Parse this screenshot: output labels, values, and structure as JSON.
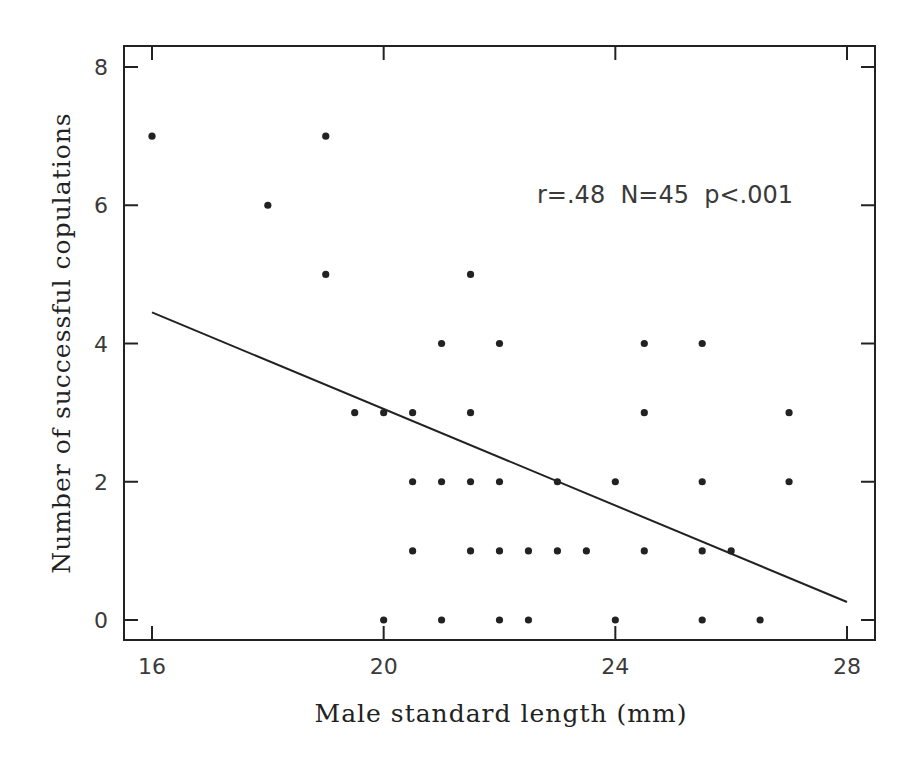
{
  "chart_data": {
    "type": "scatter",
    "title": "",
    "xlabel": "Male standard length (mm)",
    "ylabel": "Number of successful copulations",
    "xlim": [
      15.5,
      28.5
    ],
    "ylim": [
      -0.3,
      8.3
    ],
    "xticks": [
      16,
      20,
      24,
      28
    ],
    "yticks": [
      0,
      2,
      4,
      6,
      8
    ],
    "grid": false,
    "legend": null,
    "annotation": "r=.48  N=45  p<.001",
    "points": [
      {
        "x": 16,
        "y": 7
      },
      {
        "x": 19,
        "y": 7
      },
      {
        "x": 18,
        "y": 6
      },
      {
        "x": 19,
        "y": 5
      },
      {
        "x": 21.5,
        "y": 5
      },
      {
        "x": 21,
        "y": 4
      },
      {
        "x": 22,
        "y": 4
      },
      {
        "x": 24.5,
        "y": 4
      },
      {
        "x": 25.5,
        "y": 4
      },
      {
        "x": 19.5,
        "y": 3
      },
      {
        "x": 20,
        "y": 3
      },
      {
        "x": 20.5,
        "y": 3
      },
      {
        "x": 21.5,
        "y": 3
      },
      {
        "x": 24.5,
        "y": 3
      },
      {
        "x": 27,
        "y": 3
      },
      {
        "x": 20.5,
        "y": 2
      },
      {
        "x": 21,
        "y": 2
      },
      {
        "x": 21.5,
        "y": 2
      },
      {
        "x": 22,
        "y": 2
      },
      {
        "x": 23,
        "y": 2
      },
      {
        "x": 24,
        "y": 2
      },
      {
        "x": 25.5,
        "y": 2
      },
      {
        "x": 27,
        "y": 2
      },
      {
        "x": 20.5,
        "y": 1
      },
      {
        "x": 21.5,
        "y": 1
      },
      {
        "x": 22,
        "y": 1
      },
      {
        "x": 22.5,
        "y": 1
      },
      {
        "x": 23,
        "y": 1
      },
      {
        "x": 23.5,
        "y": 1
      },
      {
        "x": 24.5,
        "y": 1
      },
      {
        "x": 25.5,
        "y": 1
      },
      {
        "x": 26,
        "y": 1
      },
      {
        "x": 20,
        "y": 0
      },
      {
        "x": 21,
        "y": 0
      },
      {
        "x": 22,
        "y": 0
      },
      {
        "x": 22.5,
        "y": 0
      },
      {
        "x": 24,
        "y": 0
      },
      {
        "x": 25.5,
        "y": 0
      },
      {
        "x": 26.5,
        "y": 0
      }
    ],
    "regression_line": {
      "x": [
        16,
        28
      ],
      "y": [
        4.45,
        0.26
      ]
    },
    "stats": {
      "r": ".48",
      "N": 45,
      "p": "<.001"
    }
  },
  "colors": {
    "ink": "#222222",
    "label": "#3a3a3a",
    "background": "#ffffff"
  }
}
